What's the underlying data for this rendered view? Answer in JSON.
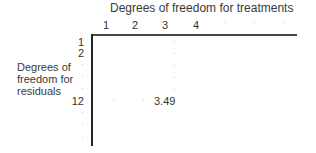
{
  "diagram": {
    "title": "Degrees of freedom for treatments",
    "column_headers": [
      "1",
      "2",
      "3",
      "4",
      "·",
      "·",
      "·"
    ],
    "row_label_lines": [
      "Degrees of",
      "freedom for",
      "residuals"
    ],
    "row_headers": [
      "1",
      "2",
      "·",
      "·",
      "·",
      "12",
      "·",
      "·",
      "·"
    ],
    "highlighted_cell": {
      "column": "3",
      "row": "12",
      "value": "3.49"
    },
    "dot": "·"
  }
}
